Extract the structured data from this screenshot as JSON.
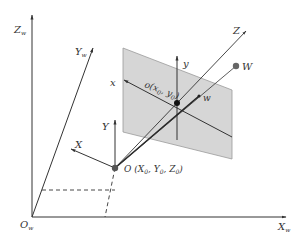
{
  "diagram": {
    "type": "camera-projection-geometry",
    "colors": {
      "line": "#333333",
      "plane_fill": "#d6d6d6",
      "plane_edge": "#9a9a9a",
      "point_O": "#555555",
      "point_W": "#666666",
      "point_o": "#111111"
    },
    "labels": {
      "world_z": {
        "main": "Z",
        "sub": "w"
      },
      "world_y": {
        "main": "Y",
        "sub": "w"
      },
      "world_x": {
        "main": "X",
        "sub": "w"
      },
      "world_origin": {
        "main": "O",
        "sub": "w"
      },
      "camera_z": "Z",
      "camera_y": "Y",
      "camera_x": "X",
      "camera_origin": {
        "prefix": "O (",
        "x": "X",
        "x_sub": "0",
        "sep1": ", ",
        "y": "Y",
        "y_sub": "0",
        "sep2": ", ",
        "z": "Z",
        "z_sub": "0",
        "suffix": ")"
      },
      "image_x": "x",
      "image_y": "y",
      "principal_point": {
        "prefix": "o(",
        "x": "x",
        "x_sub": "0",
        "sep": ", ",
        "y": "y",
        "y_sub": "0",
        "suffix": ")"
      },
      "image_point": "w",
      "world_point": "W"
    }
  }
}
